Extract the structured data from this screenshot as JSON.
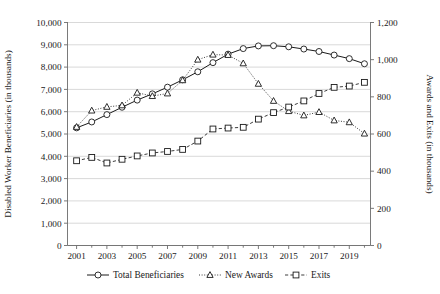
{
  "chart_data": {
    "type": "line",
    "title": "",
    "xlabel": "",
    "ylabel": "Disabled Worker Beneficiaries (in thousands)",
    "y2label": "Awards and Exits (in thousands)",
    "grid": true,
    "legend_position": "bottom",
    "x": [
      2001,
      2002,
      2003,
      2004,
      2005,
      2006,
      2007,
      2008,
      2009,
      2010,
      2011,
      2012,
      2013,
      2014,
      2015,
      2016,
      2017,
      2018,
      2019,
      2020
    ],
    "xtick_labels": [
      "2001",
      "2003",
      "2005",
      "2007",
      "2009",
      "2011",
      "2013",
      "2015",
      "2017",
      "2019"
    ],
    "xtick_values": [
      2001,
      2003,
      2005,
      2007,
      2009,
      2011,
      2013,
      2015,
      2017,
      2019
    ],
    "xlim": [
      2000.4,
      2020.4
    ],
    "ylim": [
      0,
      10000
    ],
    "ytick_labels": [
      "0",
      "1,000",
      "2,000",
      "3,000",
      "4,000",
      "5,000",
      "6,000",
      "7,000",
      "8,000",
      "9,000",
      "10,000"
    ],
    "ytick_values": [
      0,
      1000,
      2000,
      3000,
      4000,
      5000,
      6000,
      7000,
      8000,
      9000,
      10000
    ],
    "y2lim": [
      0,
      1200
    ],
    "y2tick_labels": [
      "0",
      "200",
      "400",
      "600",
      "800",
      "1,000",
      "1,200"
    ],
    "y2tick_values": [
      0,
      200,
      400,
      600,
      800,
      1000,
      1200
    ],
    "series": [
      {
        "name": "Total Beneficiaries",
        "axis": "left",
        "marker": "circle",
        "linestyle": "solid",
        "values": [
          5275,
          5540,
          5870,
          6200,
          6520,
          6800,
          7100,
          7430,
          7790,
          8200,
          8580,
          8830,
          8950,
          8960,
          8910,
          8810,
          8700,
          8540,
          8380,
          8150
        ]
      },
      {
        "name": "New Awards",
        "axis": "right",
        "marker": "triangle",
        "linestyle": "dotted",
        "values": [
          638,
          726,
          746,
          754,
          822,
          804,
          818,
          889,
          1000,
          1027,
          1025,
          980,
          870,
          778,
          723,
          700,
          718,
          673,
          663,
          602
        ]
      },
      {
        "name": "Exits",
        "axis": "right",
        "marker": "square",
        "linestyle": "dashed",
        "values": [
          456,
          474,
          444,
          464,
          482,
          498,
          506,
          517,
          562,
          627,
          632,
          636,
          680,
          715,
          745,
          778,
          818,
          851,
          858,
          878
        ]
      }
    ],
    "legend_entries": [
      "Total Beneficiaries",
      "New Awards",
      "Exits"
    ],
    "colors": {
      "line": "#1a1a1a",
      "grid": "#c8c8c8",
      "axis": "#6b6b6b",
      "background": "#ffffff"
    }
  }
}
